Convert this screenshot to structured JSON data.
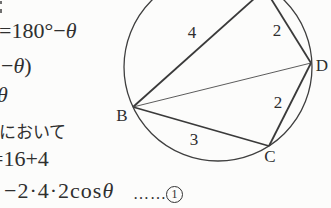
{
  "colors": {
    "background": "#fcfcfb",
    "ink": "#2f2f2f",
    "line": "#3f3f3f"
  },
  "solution_notes": {
    "line1_prefix": "=180°−",
    "line1_theta": "θ",
    "line2_prefix": "−",
    "line2_theta": "θ",
    "line2_suffix": ")",
    "line3_theta": "θ",
    "line4_japanese": "において",
    "line5": "=16+4",
    "line6_expr": "−2·4·2cos",
    "line6_theta": "θ",
    "line6_dots": "……",
    "equation_number": "1"
  },
  "diagram": {
    "vertex_labels": {
      "B": "B",
      "C": "C",
      "D": "D"
    },
    "side_labels": {
      "AB": "4",
      "AD": "2",
      "DC": "2",
      "CB": "3"
    }
  }
}
